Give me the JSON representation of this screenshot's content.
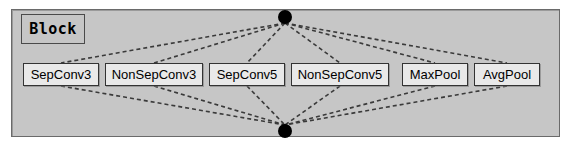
{
  "diagram": {
    "type": "neural-architecture-search-block",
    "title": "Block",
    "colors": {
      "panel_background": "#c6c6c6",
      "panel_border": "#6a6a6a",
      "op_box_fill": "#e9e9e9",
      "op_box_border": "#333333",
      "node_fill": "#000000",
      "edge_color": "#3a3a3a",
      "page_background": "#ffffff"
    },
    "nodes": [
      {
        "id": "input-node",
        "label": "",
        "cx": 285,
        "cy": 17,
        "r": 7
      },
      {
        "id": "output-node",
        "label": "",
        "cx": 285,
        "cy": 131,
        "r": 7
      }
    ],
    "operations": [
      {
        "id": "sepconv3",
        "label": "SepConv3",
        "x": 23,
        "width": 76
      },
      {
        "id": "nonsepconv3",
        "label": "NonSepConv3",
        "x": 105,
        "width": 98
      },
      {
        "id": "sepconv5",
        "label": "SepConv5",
        "x": 209,
        "width": 76
      },
      {
        "id": "nonsepconv5",
        "label": "NonSepConv5",
        "x": 291,
        "width": 98
      },
      {
        "id": "maxpool",
        "label": "MaxPool",
        "x": 402,
        "width": 66
      },
      {
        "id": "avgpool",
        "label": "AvgPool",
        "x": 474,
        "width": 66
      }
    ],
    "edges": {
      "style": "dashed",
      "from_input": [
        {
          "to": "sepconv3"
        },
        {
          "to": "nonsepconv3"
        },
        {
          "to": "sepconv5"
        },
        {
          "to": "nonsepconv5"
        },
        {
          "to": "maxpool"
        },
        {
          "to": "avgpool"
        }
      ],
      "to_output": [
        {
          "from": "sepconv3"
        },
        {
          "from": "nonsepconv3"
        },
        {
          "from": "sepconv5"
        },
        {
          "from": "nonsepconv5"
        },
        {
          "from": "maxpool"
        },
        {
          "from": "avgpool"
        }
      ]
    }
  }
}
